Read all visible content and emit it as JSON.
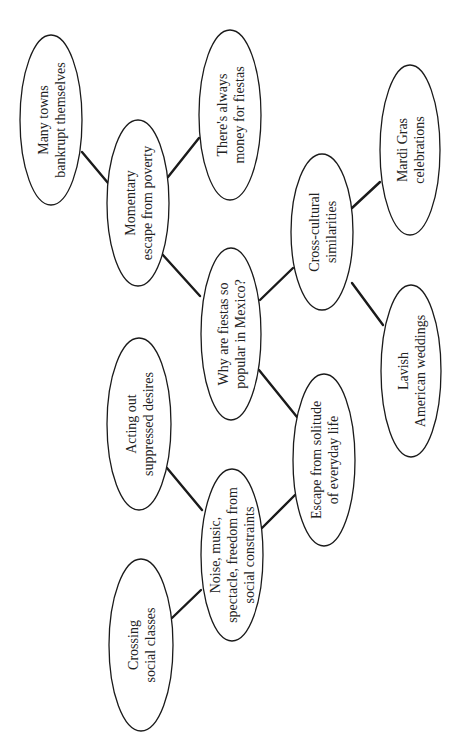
{
  "diagram": {
    "type": "cluster-map",
    "orientation": "rotated-90-ccw",
    "colors": {
      "background": "#ffffff",
      "stroke": "#1a1a1a",
      "text": "#222222"
    },
    "central_node": "why",
    "nodes": [
      {
        "id": "why",
        "lines": [
          "Why are fiestas so",
          "popular in Mexico?"
        ],
        "cx": 231,
        "cy": 334,
        "rx": 30,
        "ry": 86
      },
      {
        "id": "momentary",
        "lines": [
          "Momentary",
          "escape from poverty"
        ],
        "cx": 138,
        "cy": 203,
        "rx": 31,
        "ry": 83
      },
      {
        "id": "many-towns",
        "lines": [
          "Many towns",
          "bankrupt themselves"
        ],
        "cx": 51,
        "cy": 120,
        "rx": 31,
        "ry": 85
      },
      {
        "id": "always-money",
        "lines": [
          "There's always",
          "money for fiestas"
        ],
        "cx": 230,
        "cy": 115,
        "rx": 31,
        "ry": 85
      },
      {
        "id": "cross-cultural",
        "lines": [
          "Cross-cultural",
          "similarities"
        ],
        "cx": 322,
        "cy": 232,
        "rx": 31,
        "ry": 78
      },
      {
        "id": "mardi-gras",
        "lines": [
          "Mardi Gras",
          "celebrations"
        ],
        "cx": 410,
        "cy": 150,
        "rx": 30,
        "ry": 85
      },
      {
        "id": "lavish",
        "lines": [
          "Lavish",
          "American weddings"
        ],
        "cx": 411,
        "cy": 371,
        "rx": 30,
        "ry": 86
      },
      {
        "id": "escape-solitude",
        "lines": [
          "Escape from solitude",
          "of everyday life"
        ],
        "cx": 324,
        "cy": 460,
        "rx": 31,
        "ry": 86
      },
      {
        "id": "noise-music",
        "lines": [
          "Noise, music,",
          "spectacle, freedom from",
          "social constraints"
        ],
        "cx": 232,
        "cy": 555,
        "rx": 31,
        "ry": 86
      },
      {
        "id": "acting-out",
        "lines": [
          "Acting out",
          "suppressed desires"
        ],
        "cx": 139,
        "cy": 424,
        "rx": 32,
        "ry": 86
      },
      {
        "id": "crossing",
        "lines": [
          "Crossing",
          "social classes"
        ],
        "cx": 141,
        "cy": 645,
        "rx": 32,
        "ry": 86
      }
    ],
    "edges": [
      {
        "from": "many-towns",
        "to": "momentary",
        "x1": 82,
        "y1": 152,
        "x2": 108,
        "y2": 183
      },
      {
        "from": "momentary",
        "to": "always-money",
        "x1": 168,
        "y1": 177,
        "x2": 199,
        "y2": 138
      },
      {
        "from": "momentary",
        "to": "why",
        "x1": 162,
        "y1": 254,
        "x2": 200,
        "y2": 296
      },
      {
        "from": "why",
        "to": "cross-cultural",
        "x1": 260,
        "y1": 300,
        "x2": 293,
        "y2": 268
      },
      {
        "from": "cross-cultural",
        "to": "mardi-gras",
        "x1": 352,
        "y1": 208,
        "x2": 380,
        "y2": 182
      },
      {
        "from": "cross-cultural",
        "to": "lavish",
        "x1": 352,
        "y1": 283,
        "x2": 383,
        "y2": 325
      },
      {
        "from": "why",
        "to": "escape-solitude",
        "x1": 259,
        "y1": 370,
        "x2": 297,
        "y2": 417
      },
      {
        "from": "escape-solitude",
        "to": "noise-music",
        "x1": 295,
        "y1": 495,
        "x2": 262,
        "y2": 528
      },
      {
        "from": "acting-out",
        "to": "noise-music",
        "x1": 167,
        "y1": 468,
        "x2": 202,
        "y2": 510
      },
      {
        "from": "crossing",
        "to": "noise-music",
        "x1": 172,
        "y1": 618,
        "x2": 201,
        "y2": 590
      }
    ]
  }
}
